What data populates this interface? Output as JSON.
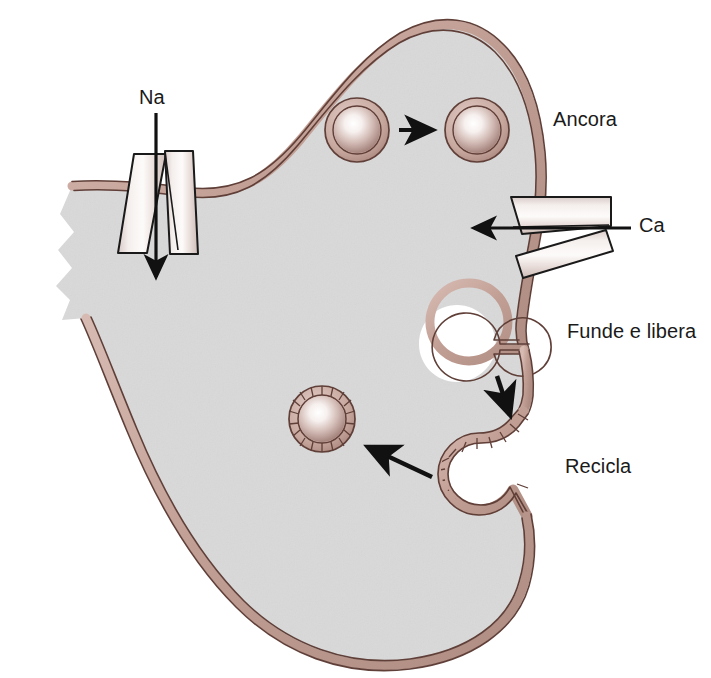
{
  "figure": {
    "type": "cell-biology-diagram",
    "background_color": "#ffffff"
  },
  "colors": {
    "cytoplasm": "#d9d9d9",
    "membrane_fill": "#c7a79d",
    "membrane_stroke": "#5f3f38",
    "vesicle_core_highlight": "#ffffff",
    "vesicle_core_edge": "#a88b85",
    "vesicle_ring": "#c4a49b",
    "vesicle_ring_stroke": "#5f3f38",
    "channel_fill": "#e8dedb",
    "channel_stroke": "#1a1a1a",
    "arrow_color": "#111111",
    "label_color": "#1a1a1a",
    "page_background": "#ffffff"
  },
  "labels": {
    "sodium": "Na",
    "calcium": "Ca",
    "anchor": "Ancora",
    "fuse_and_release": "Funde e libera",
    "recycle": "Recicla"
  },
  "structures": {
    "cell": {
      "name": "presynaptic-terminal",
      "description": "Terminal nervoso pre-sinaptico com borda rasgada a esquerda"
    },
    "channels": [
      {
        "id": "sodium-channel",
        "label": "Na",
        "orientation": "vertical",
        "arrow_direction": "down",
        "location": "upper-left-membrane",
        "cylinders": 2
      },
      {
        "id": "calcium-channel",
        "label": "Ca",
        "orientation": "horizontal",
        "arrow_direction": "left",
        "location": "right-membrane",
        "cylinders": 2
      }
    ],
    "vesicles": [
      {
        "id": "vesicle-docked-1",
        "kind": "clear-vesicle",
        "cx": 357,
        "cy": 130,
        "r_outer": 32,
        "r_core": 23,
        "stage": "anchored"
      },
      {
        "id": "vesicle-docked-2",
        "kind": "clear-vesicle",
        "cx": 477,
        "cy": 130,
        "r_outer": 32,
        "r_core": 23,
        "stage": "anchored"
      },
      {
        "id": "vesicle-coated",
        "kind": "clathrin-coated-vesicle",
        "cx": 322,
        "cy": 419,
        "r_outer": 33,
        "r_core": 23,
        "stage": "recycled",
        "coat_spokes": 18
      }
    ],
    "membrane_events": [
      {
        "id": "fusion-pore",
        "label": "Funde e libera",
        "description": "Abertura omega na membrana onde a vesicula funde e libera o conteudo"
      },
      {
        "id": "coated-pit",
        "label": "Recicla",
        "description": "Fosseta revestida de clatrina reabsorvendo a membrana"
      }
    ],
    "arrows": [
      {
        "id": "arrow-na-influx",
        "from": "exterior",
        "to": "cytoplasm",
        "direction": "down"
      },
      {
        "id": "arrow-ca-influx",
        "from": "exterior",
        "to": "cytoplasm",
        "direction": "left"
      },
      {
        "id": "arrow-vesicle-transport",
        "from": "vesicle-docked-1",
        "to": "vesicle-docked-2",
        "direction": "right"
      },
      {
        "id": "arrow-fuse-to-pit",
        "from": "fusion-pore",
        "to": "coated-pit",
        "direction": "down"
      },
      {
        "id": "arrow-pit-to-vesicle",
        "from": "coated-pit",
        "to": "vesicle-coated",
        "direction": "left"
      }
    ]
  }
}
